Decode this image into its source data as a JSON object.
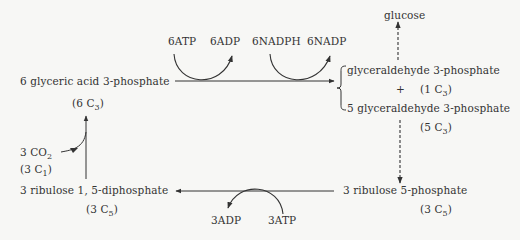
{
  "diagram": {
    "nodes": {
      "pga": {
        "label": "6 glyceric acid 3-phosphate",
        "carbon_base": "6 C",
        "carbon_sub": "3"
      },
      "g3p_top": {
        "label": "glyceraldehyde 3-phosphate"
      },
      "plus": {
        "label": "+"
      },
      "g3p_one": {
        "carbon_base": "(1 C",
        "carbon_sub": "3",
        "carbon_close": ")"
      },
      "g3p_five": {
        "label": "5 glyceraldehyde 3-phosphate",
        "carbon_base": "(5 C",
        "carbon_sub": "3",
        "carbon_close": ")"
      },
      "glucose": {
        "label": "glucose"
      },
      "ru5p": {
        "label": "3 ribulose 5-phosphate",
        "carbon_base": "(3 C",
        "carbon_sub": "5",
        "carbon_close": ")"
      },
      "rudp": {
        "label": "3 ribulose 1, 5-diphosphate",
        "carbon_base": "(3 C",
        "carbon_sub": "5",
        "carbon_close": ")"
      },
      "co2": {
        "label_base": "3 CO",
        "label_sub": "2",
        "carbon_base": "(3 C",
        "carbon_sub": "1",
        "carbon_close": ")"
      },
      "six_c3": {
        "carbon_base": "(6 C",
        "carbon_sub": "3",
        "carbon_close": ")"
      }
    },
    "cofactors": {
      "atp_in_top": "6ATP",
      "adp_out_top": "6ADP",
      "nadph_in": "6NADPH",
      "nadp_out": "6NADP",
      "adp_out_bottom": "3ADP",
      "atp_in_bottom": "3ATP"
    },
    "colors": {
      "line": "#333333",
      "text": "#333333",
      "background": "#f7f7f5"
    }
  }
}
